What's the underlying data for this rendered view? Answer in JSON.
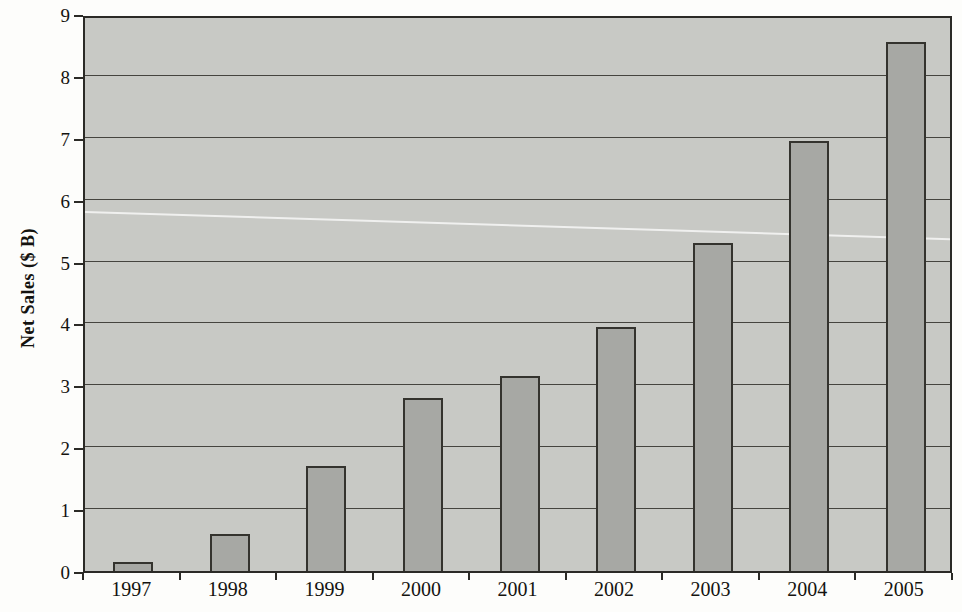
{
  "chart_data": {
    "type": "bar",
    "title": "",
    "xlabel": "",
    "ylabel": "Net Sales ($ B)",
    "categories": [
      "1997",
      "1998",
      "1999",
      "2000",
      "2001",
      "2002",
      "2003",
      "2004",
      "2005"
    ],
    "values": [
      0.15,
      0.6,
      1.7,
      2.8,
      3.15,
      3.95,
      5.3,
      6.95,
      8.55
    ],
    "ylim": [
      0,
      9
    ],
    "yticks": [
      0,
      1,
      2,
      3,
      4,
      5,
      6,
      7,
      8,
      9
    ],
    "grid": true,
    "legend": false,
    "bar_color": "#a7a8a4",
    "bar_border_color": "#34332e",
    "plot_background_color": "#c8c9c5",
    "gridline_color": "#45443f",
    "axis_color": "#2b2a26",
    "page_background_color": "#fdfdfb",
    "text_color": "#14130f",
    "artifact": "faint white diagonal scan crease across plot"
  }
}
